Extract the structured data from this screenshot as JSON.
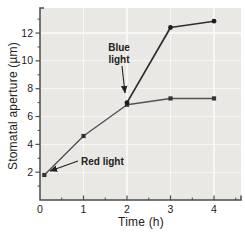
{
  "figure": {
    "bg_color": "#ffffff",
    "plot_bg_color": "#e9e8e4",
    "grid_color": "#f8f7f4",
    "axis_color": "#4b4b4b",
    "text_color": "#222222"
  },
  "chart_data": {
    "type": "line",
    "title": "",
    "xlabel": "Time (h)",
    "ylabel": "Stomatal aperture (µm)",
    "xlim": [
      0,
      4.62
    ],
    "ylim": [
      0,
      13.8
    ],
    "x_ticks": {
      "major": [
        0,
        1,
        2,
        3,
        4
      ],
      "minor": [
        0.5,
        1.5,
        2.5,
        3.5,
        4.5
      ]
    },
    "y_ticks": {
      "major": [
        2,
        4,
        6,
        8,
        10,
        12
      ],
      "minor": [
        1,
        3,
        5,
        7,
        9,
        11,
        13
      ]
    },
    "grid": {
      "show": true,
      "x_lines": [
        1,
        2,
        3,
        4
      ],
      "y_lines": [
        2,
        4,
        6,
        8,
        10,
        12
      ]
    },
    "legend_position": "none (series labeled by in-plot annotations)",
    "series": [
      {
        "name": "Red light",
        "marker": "square",
        "line_color": "#525252",
        "marker_color": "#333333",
        "line_width": 1.4,
        "points": [
          [
            0.1,
            1.8
          ],
          [
            1,
            4.6
          ],
          [
            2,
            6.85
          ],
          [
            3,
            7.3
          ],
          [
            4,
            7.3
          ]
        ]
      },
      {
        "name": "Blue light",
        "marker": "circle",
        "line_color": "#2e2e2e",
        "marker_color": "#1c1c1c",
        "line_width": 1.7,
        "points": [
          [
            2,
            7.0
          ],
          [
            3,
            12.4
          ],
          [
            4,
            12.85
          ]
        ]
      }
    ],
    "annotations": [
      {
        "id": "blue-light-label",
        "lines": [
          "Blue",
          "light"
        ],
        "anchor": "middle",
        "text_px": {
          "x": 119,
          "y": 51,
          "line_height": 12
        },
        "arrow_px": {
          "x1": 122,
          "y1": 66,
          "x2": 125,
          "y2": 93
        }
      },
      {
        "id": "red-light-label",
        "lines": [
          "Red light"
        ],
        "anchor": "start",
        "text_px": {
          "x": 81,
          "y": 165,
          "line_height": 12
        },
        "arrow_px": {
          "x1": 78,
          "y1": 161,
          "x2": 50,
          "y2": 171
        }
      }
    ]
  }
}
